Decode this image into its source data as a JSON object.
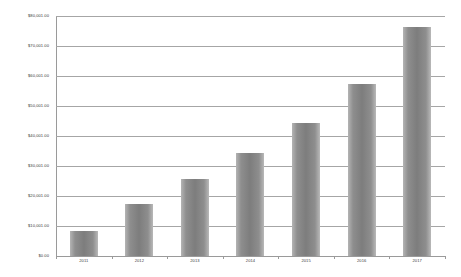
{
  "chart_data": {
    "type": "bar",
    "title": "",
    "xlabel": "",
    "ylabel": "",
    "categories": [
      "2011",
      "2012",
      "2013",
      "2014",
      "2015",
      "2016",
      "2017"
    ],
    "values": [
      8500,
      17500,
      25800,
      34500,
      44500,
      57500,
      76500
    ],
    "series": [
      {
        "name": "Amount",
        "values": [
          8500,
          17500,
          25800,
          34500,
          44500,
          57500,
          76500
        ]
      }
    ],
    "ylim": [
      0,
      80001
    ],
    "ytick_values": [
      0,
      10001,
      20001,
      30001,
      40001,
      50001,
      60001,
      70001,
      80001
    ],
    "ytick_labels": [
      "$0.00",
      "$10,001.00",
      "$20,001.00",
      "$30,001.00",
      "$40,001.00",
      "$50,001.00",
      "$60,001.00",
      "$70,001.00",
      "$80,001.00"
    ],
    "grid": true,
    "legend": false,
    "legend_position": "none",
    "bar_color": "#7d7d7d",
    "gridline_color": "#a6a6a6",
    "axis_color": "#9a9a9a",
    "background_color": "#ffffff",
    "text_color": "#404040"
  }
}
